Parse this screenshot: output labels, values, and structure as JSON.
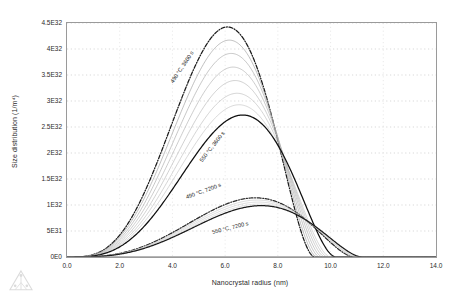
{
  "chart_data": {
    "type": "line",
    "title": "",
    "xlabel": "Nanocrystal radius (nm)",
    "ylabel": "Size distribution (1/m⁴)",
    "xlim": [
      0.0,
      14.0
    ],
    "ylim": [
      0,
      4.5e+32
    ],
    "grid": true,
    "legend_position": "inline-annotations",
    "xticks": [
      "0.0",
      "2.0",
      "4.0",
      "6.0",
      "8.0",
      "10.0",
      "12.0",
      "14.0"
    ],
    "xtick_values": [
      0.0,
      2.0,
      4.0,
      6.0,
      8.0,
      10.0,
      12.0,
      14.0
    ],
    "yticks": [
      "0E0",
      "5E31",
      "1E32",
      "1.5E32",
      "2E32",
      "2.5E32",
      "3E32",
      "3.5E32",
      "4E32",
      "4.5E32"
    ],
    "ytick_values": [
      0,
      5e+31,
      1e+32,
      1.5e+32,
      2e+32,
      2.5e+32,
      3e+32,
      3.5e+32,
      4e+32,
      4.5e+32
    ],
    "annotations": [
      {
        "text": "490 °C, 3600 s",
        "x": 4.05,
        "y": 3.45e+32,
        "rotation": -56
      },
      {
        "text": "550 °C, 3600 s",
        "x": 5.15,
        "y": 1.92e+32,
        "rotation": -52
      },
      {
        "text": "490 °C, 7200 s",
        "x": 4.55,
        "y": 1.22e+32,
        "rotation": -20
      },
      {
        "text": "550 °C, 7200 s",
        "x": 5.55,
        "y": 5.3e+31,
        "rotation": -14
      }
    ],
    "series": [
      {
        "name": "490 °C, 3600 s",
        "style": "dash-dot",
        "color": "#1a1a1a",
        "peak_x": 5.35,
        "peak_y": 4.13e+32,
        "cutoff_x": 9.4,
        "width": 1.6,
        "skew": 0.55
      },
      {
        "name": "intermediate-1",
        "style": "solid",
        "color": "#9e9e9e",
        "peak_x": 5.45,
        "peak_y": 3.92e+32,
        "cutoff_x": 9.5,
        "width": 1.62,
        "skew": 0.55
      },
      {
        "name": "intermediate-2",
        "style": "solid",
        "color": "#a8a8a8",
        "peak_x": 5.55,
        "peak_y": 3.7e+32,
        "cutoff_x": 9.6,
        "width": 1.66,
        "skew": 0.55
      },
      {
        "name": "intermediate-3",
        "style": "solid",
        "color": "#b0b0b0",
        "peak_x": 5.65,
        "peak_y": 3.47e+32,
        "cutoff_x": 9.7,
        "width": 1.7,
        "skew": 0.55
      },
      {
        "name": "intermediate-4",
        "style": "solid",
        "color": "#b6b6b6",
        "peak_x": 5.75,
        "peak_y": 3.24e+32,
        "cutoff_x": 9.8,
        "width": 1.74,
        "skew": 0.55
      },
      {
        "name": "intermediate-5",
        "style": "solid",
        "color": "#bcbcbc",
        "peak_x": 5.85,
        "peak_y": 3.02e+32,
        "cutoff_x": 9.9,
        "width": 1.78,
        "skew": 0.55
      },
      {
        "name": "intermediate-6",
        "style": "solid",
        "color": "#c2c2c2",
        "peak_x": 5.95,
        "peak_y": 2.82e+32,
        "cutoff_x": 10.0,
        "width": 1.82,
        "skew": 0.55
      },
      {
        "name": "550 °C, 3600 s",
        "style": "solid",
        "color": "#0f0f0f",
        "peak_x": 6.05,
        "peak_y": 2.62e+32,
        "cutoff_x": 10.2,
        "width": 1.88,
        "skew": 0.55
      },
      {
        "name": "490 °C, 7200 s",
        "style": "dash-dot",
        "color": "#2a2a2a",
        "peak_x": 7.55,
        "peak_y": 1.12e+32,
        "cutoff_x": 10.9,
        "width": 2.35,
        "skew": 0.5
      },
      {
        "name": "intermediate-7",
        "style": "solid",
        "color": "#c6c6c6",
        "peak_x": 7.7,
        "peak_y": 1.07e+32,
        "cutoff_x": 11.0,
        "width": 2.4,
        "skew": 0.5
      },
      {
        "name": "intermediate-8",
        "style": "solid",
        "color": "#cacaca",
        "peak_x": 7.85,
        "peak_y": 1.02e+32,
        "cutoff_x": 11.05,
        "width": 2.45,
        "skew": 0.5
      },
      {
        "name": "intermediate-9",
        "style": "solid",
        "color": "#cfcfcf",
        "peak_x": 8.0,
        "peak_y": 9.7e+31,
        "cutoff_x": 11.1,
        "width": 2.5,
        "skew": 0.5
      },
      {
        "name": "550 °C, 7200 s",
        "style": "solid",
        "color": "#1a1a1a",
        "peak_x": 8.15,
        "peak_y": 9.3e+31,
        "cutoff_x": 11.2,
        "width": 2.55,
        "skew": 0.5
      }
    ]
  },
  "watermark": {
    "name": "triangle-logo"
  }
}
